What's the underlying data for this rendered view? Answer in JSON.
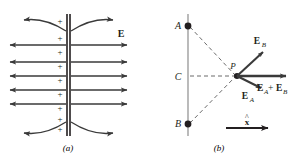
{
  "figure": {
    "caption_a": "(a)",
    "caption_b": "(b)",
    "background_color": "#ffffff",
    "ink_color": "#231f20",
    "line_color": "#3a3a3a"
  },
  "panel_a": {
    "name": "uniform-field-charged-plane",
    "description": "Charged plane seen edge-on with plus signs and horizontal field lines pointing away on both sides, fringing curves at top and bottom",
    "field_label": "E",
    "plus_sign": "+",
    "plus_count": 11,
    "field_line_count": 6,
    "fringe_curve_count": 2,
    "plate_x": 67,
    "arrow_rows_y": [
      52,
      66,
      80,
      94,
      108
    ],
    "extra_row_y": 38
  },
  "panel_b": {
    "name": "superposition-two-charges",
    "description": "Vertical line with charges A (top) and B (bottom), point C at middle, dashed lines converging at field point P where vectors E_A, E_B and their sum are drawn",
    "point_a_label": "A",
    "point_b_label": "B",
    "point_c_label": "C",
    "field_point_label": "P",
    "vector_ea_label": "E",
    "vector_ea_sub": "A",
    "vector_eb_label": "E",
    "vector_eb_sub": "B",
    "vector_sum_label": "E",
    "vector_sum_sub_a": "A",
    "vector_sum_plus": "+",
    "vector_sum_label2": "E",
    "vector_sum_sub_b": "B",
    "unit_vector_label": "x",
    "unit_vector_hat": "^",
    "axis_x": 39,
    "point_a_y": 26,
    "point_c_y": 76,
    "point_b_y": 124,
    "field_point_x": 88,
    "field_point_y": 76
  }
}
